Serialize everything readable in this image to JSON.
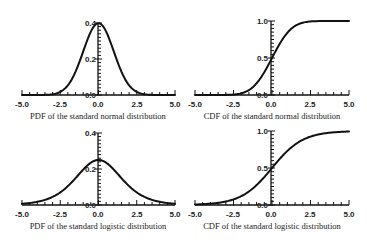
{
  "chart_data": [
    {
      "type": "line",
      "title": "PDF of the standard normal distribution",
      "xlabel": "",
      "ylabel": "",
      "xlim": [
        -5.0,
        5.0
      ],
      "ylim": [
        0.0,
        0.4
      ],
      "x_ticks": [
        "-5.0",
        "-2.5",
        "0.0",
        "2.5",
        "5.0"
      ],
      "y_ticks": [
        "0.0",
        "0.2",
        "0.4"
      ],
      "grid": false,
      "series": [
        {
          "name": "normal pdf",
          "x": [
            -5.0,
            -4.0,
            -3.0,
            -2.5,
            -2.0,
            -1.5,
            -1.0,
            -0.5,
            0.0,
            0.5,
            1.0,
            1.5,
            2.0,
            2.5,
            3.0,
            4.0,
            5.0
          ],
          "y": [
            0.0,
            0.0001,
            0.0044,
            0.0175,
            0.054,
            0.1295,
            0.242,
            0.3521,
            0.3989,
            0.3521,
            0.242,
            0.1295,
            0.054,
            0.0175,
            0.0044,
            0.0001,
            0.0
          ]
        }
      ]
    },
    {
      "type": "line",
      "title": "CDF of the standard normal distribution",
      "xlabel": "",
      "ylabel": "",
      "xlim": [
        -5.0,
        5.0
      ],
      "ylim": [
        0.0,
        1.0
      ],
      "x_ticks": [
        "-5.0",
        "-2.5",
        "0.0",
        "2.5",
        "5.0"
      ],
      "y_ticks": [
        "0.0",
        "0.5",
        "1.0"
      ],
      "grid": false,
      "series": [
        {
          "name": "normal cdf",
          "x": [
            -5.0,
            -4.0,
            -3.0,
            -2.5,
            -2.0,
            -1.5,
            -1.0,
            -0.5,
            0.0,
            0.5,
            1.0,
            1.5,
            2.0,
            2.5,
            3.0,
            4.0,
            5.0
          ],
          "y": [
            0.0,
            0.0,
            0.0013,
            0.0062,
            0.0228,
            0.0668,
            0.1587,
            0.3085,
            0.5,
            0.6915,
            0.8413,
            0.9332,
            0.9772,
            0.9938,
            0.9987,
            1.0,
            1.0
          ]
        }
      ]
    },
    {
      "type": "line",
      "title": "PDF of the standard logistic distribution",
      "xlabel": "",
      "ylabel": "",
      "xlim": [
        -5.0,
        5.0
      ],
      "ylim": [
        0.0,
        0.4
      ],
      "x_ticks": [
        "-5.0",
        "-2.5",
        "0.0",
        "2.5",
        "5.0"
      ],
      "y_ticks": [
        "0.0",
        "0.2",
        "0.4"
      ],
      "grid": false,
      "series": [
        {
          "name": "logistic pdf",
          "x": [
            -5.0,
            -4.0,
            -3.0,
            -2.5,
            -2.0,
            -1.5,
            -1.0,
            -0.5,
            0.0,
            0.5,
            1.0,
            1.5,
            2.0,
            2.5,
            3.0,
            4.0,
            5.0
          ],
          "y": [
            0.0066,
            0.0177,
            0.0452,
            0.0701,
            0.105,
            0.1491,
            0.1966,
            0.235,
            0.25,
            0.235,
            0.1966,
            0.1491,
            0.105,
            0.0701,
            0.0452,
            0.0177,
            0.0066
          ]
        }
      ]
    },
    {
      "type": "line",
      "title": "CDF of the standard logistic distribution",
      "xlabel": "",
      "ylabel": "",
      "xlim": [
        -5.0,
        5.0
      ],
      "ylim": [
        0.0,
        1.0
      ],
      "x_ticks": [
        "-5.0",
        "-2.5",
        "0.0",
        "2.5",
        "5.0"
      ],
      "y_ticks": [
        "0.0",
        "0.5",
        "1.0"
      ],
      "grid": false,
      "series": [
        {
          "name": "logistic cdf",
          "x": [
            -5.0,
            -4.0,
            -3.0,
            -2.5,
            -2.0,
            -1.5,
            -1.0,
            -0.5,
            0.0,
            0.5,
            1.0,
            1.5,
            2.0,
            2.5,
            3.0,
            4.0,
            5.0
          ],
          "y": [
            0.0067,
            0.018,
            0.0474,
            0.0759,
            0.1192,
            0.1824,
            0.2689,
            0.3775,
            0.5,
            0.6225,
            0.7311,
            0.8176,
            0.8808,
            0.9241,
            0.9526,
            0.982,
            0.9933
          ]
        }
      ]
    }
  ],
  "panels": [
    {
      "caption": "PDF of the standard normal distribution",
      "x_ticks": [
        "-5.0",
        "-2.5",
        "0.0",
        "2.5",
        "5.0"
      ],
      "y_ticks": [
        "0.0",
        "0.2",
        "0.4"
      ]
    },
    {
      "caption": "CDF of the standard normal distribution",
      "x_ticks": [
        "-5.0",
        "-2.5",
        "0.0",
        "2.5",
        "5.0"
      ],
      "y_ticks": [
        "0.0",
        "0.5",
        "1.0"
      ]
    },
    {
      "caption": "PDF of the standard logistic distribution",
      "x_ticks": [
        "-5.0",
        "-2.5",
        "0.0",
        "2.5",
        "5.0"
      ],
      "y_ticks": [
        "0.0",
        "0.2",
        "0.4"
      ]
    },
    {
      "caption": "CDF of the standard logistic distribution",
      "x_ticks": [
        "-5.0",
        "-2.5",
        "0.0",
        "2.5",
        "5.0"
      ],
      "y_ticks": [
        "0.0",
        "0.5",
        "1.0"
      ]
    }
  ]
}
